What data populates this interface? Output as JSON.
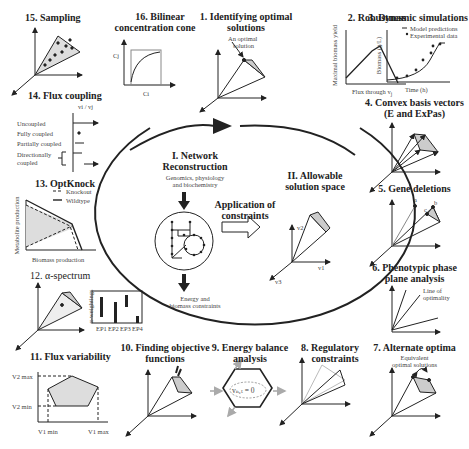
{
  "center": {
    "network": {
      "title_line1": "I. Network",
      "title_line2": "Reconstruction",
      "sub_line1": "Genomics, physiology",
      "sub_line2": "and  biochemistry",
      "bottom_line1": "Energy and",
      "bottom_line2": "biomass constraints"
    },
    "constraints": {
      "line1": "Application of",
      "line2": "constraints"
    },
    "solution_space": {
      "line1": "II. Allowable",
      "line2": "solution space",
      "axis_v1": "v1",
      "axis_v2": "v2",
      "axis_v3": "v3"
    }
  },
  "panels": {
    "p1": {
      "line1": "1. Identifying optimal",
      "line2": "solutions",
      "note1": "An optimal",
      "note2": "solution"
    },
    "p2": {
      "title": "2. Robustness",
      "ylabel": "Maximal biomass yield",
      "xlabel": "Flux through v",
      "xsub": "j"
    },
    "p3": {
      "title": "3. Dynamic simulations",
      "legend_model": "Model predictions",
      "legend_exp": "Experimental data",
      "ylabel": "Biomass (g/L)",
      "xlabel": "Time (h)"
    },
    "p4": {
      "line1": "4. Convex basis vectors",
      "line2": "(E and ExPas)"
    },
    "p5": {
      "title": "5. Gene deletions",
      "a": "a",
      "b": "b",
      "c": "c"
    },
    "p6": {
      "line1": "6. Phenotypic phase",
      "line2": "plane analysis",
      "note1": "Line of",
      "note2": "optimality"
    },
    "p7": {
      "title": "7. Alternate optima",
      "note1": "Equivalent",
      "note2": "optimal solutions"
    },
    "p8": {
      "line1": "8. Regulatory",
      "line2": "constraints"
    },
    "p9": {
      "line1": "9. Energy balance",
      "line2": "analysis",
      "eq": "vₙₑₜ = 0"
    },
    "p10": {
      "line1": "10. Finding  objective",
      "line2": "functions"
    },
    "p11": {
      "title": "11. Flux variability",
      "v2max": "V2 max",
      "v2min": "V2 min",
      "v1min": "V1 min",
      "v1max": "V1 max"
    },
    "p12": {
      "title": "12. α-spectrum",
      "ylabel": "α-weightings",
      "bars": [
        "EP1",
        "EP2",
        "EP3",
        "EP4"
      ]
    },
    "p13": {
      "title": "13. OptKnock",
      "legend_ko": "Knockout",
      "legend_wt": "Wildtype",
      "ylabel": "Metabolite production",
      "xlabel": "Biomass production"
    },
    "p14": {
      "title": "14. Flux coupling",
      "ratio": "vi / vj",
      "rows": [
        "Uncoupled",
        "Fully coupled",
        "Partially coupled",
        "Directionally",
        "coupled"
      ]
    },
    "p15": {
      "title": "15. Sampling"
    },
    "p16": {
      "line1": "16. Bilinear",
      "line2": "concentration cone",
      "ylabel": "Cj",
      "xlabel": "Ci"
    }
  }
}
